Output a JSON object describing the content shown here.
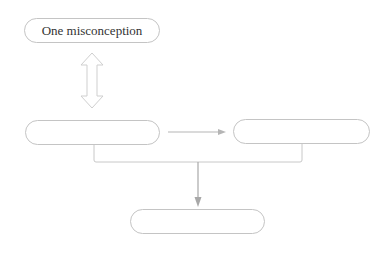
{
  "diagram": {
    "nodes": [
      {
        "id": "top",
        "label": "One misconception"
      },
      {
        "id": "middle-left",
        "label": ""
      },
      {
        "id": "middle-right",
        "label": ""
      },
      {
        "id": "bottom",
        "label": ""
      }
    ],
    "edges": [
      {
        "from": "top",
        "to": "middle-left",
        "type": "bidirectional-hollow-arrow"
      },
      {
        "from": "middle-left",
        "to": "middle-right",
        "type": "arrow"
      },
      {
        "from": [
          "middle-left",
          "middle-right"
        ],
        "to": "bottom",
        "type": "merge-arrow"
      }
    ],
    "colors": {
      "border": "#c4c4c4",
      "arrow": "#aaaaaa",
      "text": "#333333"
    }
  }
}
